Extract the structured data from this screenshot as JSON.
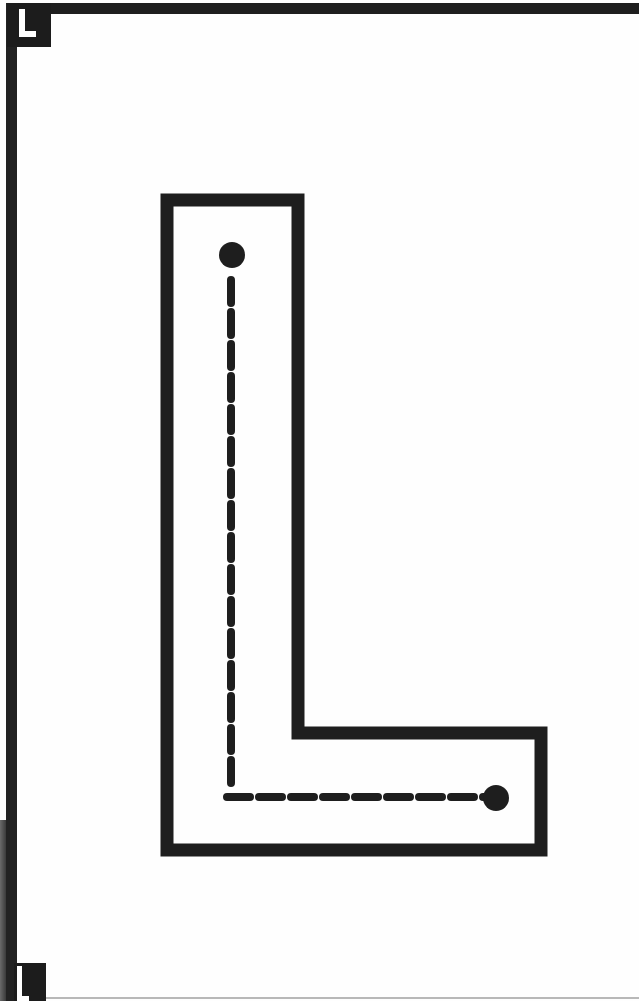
{
  "worksheet": {
    "letter": "L",
    "corner_tab_top_label": "L",
    "corner_tab_bottom_label": "L",
    "activity": "trace the dashed line from the start dot to the end dot"
  },
  "colors": {
    "ink": "#1e1e1e",
    "paper": "#fefefe",
    "tab": "#1c1c1c",
    "tab_letter": "#ffffff"
  },
  "letter_outline": {
    "stroke_width": 13,
    "points": [
      [
        167,
        200
      ],
      [
        298,
        200
      ],
      [
        298,
        733
      ],
      [
        541,
        733
      ],
      [
        541,
        850
      ],
      [
        167,
        850
      ]
    ]
  },
  "trace_path": {
    "start_dot": {
      "x": 232,
      "y": 255,
      "r": 13
    },
    "end_dot": {
      "x": 496,
      "y": 798,
      "r": 13
    },
    "vertical": {
      "x": 231,
      "y1": 280,
      "y2": 784
    },
    "horizontal": {
      "y": 797,
      "x1": 227,
      "x2": 484
    },
    "dash_length": 23,
    "dash_gap": 9,
    "dash_width": 8
  }
}
